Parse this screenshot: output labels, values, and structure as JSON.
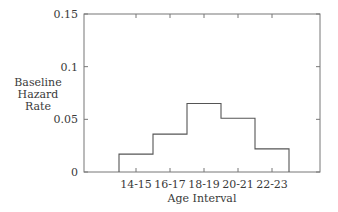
{
  "chart_data": {
    "type": "step",
    "title": "",
    "xlabel": "Age Interval",
    "ylabel": "Baseline Hazard Rate",
    "ylabel_lines": [
      "Baseline",
      "Hazard",
      "Rate"
    ],
    "categories": [
      "14-15",
      "16-17",
      "18-19",
      "20-21",
      "22-23"
    ],
    "values": [
      0.017,
      0.036,
      0.065,
      0.051,
      0.022
    ],
    "ylim": [
      0,
      0.15
    ],
    "yticks": [
      0,
      0.05,
      0.1,
      0.15
    ],
    "ytick_labels": [
      "0",
      "0.05",
      "0.1",
      "0.15"
    ],
    "grid": false,
    "legend": null
  },
  "colors": {
    "line": "#555555",
    "frame": "#777777",
    "text": "#3a3a3a"
  }
}
